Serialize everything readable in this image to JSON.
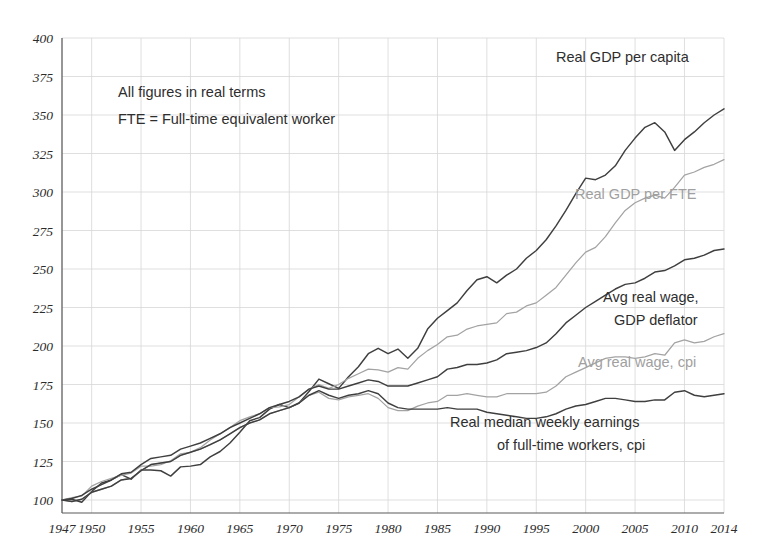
{
  "chart_data": {
    "type": "line",
    "title": "",
    "xlabel": "",
    "ylabel": "",
    "xlim": [
      1947,
      2014
    ],
    "ylim": [
      100,
      400
    ],
    "ytick_step": 25,
    "grid": true,
    "legend_position": "inline-annotations",
    "index_base": "1947 = 100",
    "yticks": [
      "400",
      "375",
      "350",
      "325",
      "300",
      "275",
      "250",
      "225",
      "200",
      "175",
      "150",
      "125",
      "100"
    ],
    "xticks": [
      "1947",
      "1950",
      "1955",
      "1960",
      "1965",
      "1970",
      "1975",
      "1980",
      "1985",
      "1990",
      "1995",
      "2000",
      "2005",
      "2010",
      "2014"
    ],
    "annotations": [
      "All figures in real terms",
      "FTE = Full-time equivalent worker"
    ],
    "colors": {
      "dark": "#3f3f3f",
      "gray": "#a3a3a3",
      "grid": "#d7d7d7",
      "axis": "#5a5a5a"
    },
    "x": [
      1947,
      1948,
      1949,
      1950,
      1951,
      1952,
      1953,
      1954,
      1955,
      1956,
      1957,
      1958,
      1959,
      1960,
      1961,
      1962,
      1963,
      1964,
      1965,
      1966,
      1967,
      1968,
      1969,
      1970,
      1971,
      1972,
      1973,
      1974,
      1975,
      1976,
      1977,
      1978,
      1979,
      1980,
      1981,
      1982,
      1983,
      1984,
      1985,
      1986,
      1987,
      1988,
      1989,
      1990,
      1991,
      1992,
      1993,
      1994,
      1995,
      1996,
      1997,
      1998,
      1999,
      2000,
      2001,
      2002,
      2003,
      2004,
      2005,
      2006,
      2007,
      2008,
      2009,
      2010,
      2011,
      2012,
      2013,
      2014
    ],
    "series": [
      {
        "name": "Real GDP per capita",
        "color": "#3f3f3f",
        "label_text": "Real GDP per capita",
        "label_style": "dark",
        "values": [
          100,
          100.5,
          98.5,
          105.5,
          111,
          113,
          116.5,
          113.5,
          119.5,
          119.5,
          119,
          115.5,
          121.5,
          122,
          123,
          128,
          131.5,
          137,
          144,
          151.5,
          153.5,
          159,
          162,
          160,
          163,
          170.5,
          178.5,
          175.5,
          172.5,
          180,
          186.5,
          195,
          198.5,
          195,
          198,
          192,
          198.5,
          211,
          218,
          223,
          228,
          236,
          243,
          245,
          241,
          246,
          250,
          257,
          262,
          269,
          278,
          288,
          299,
          309,
          308,
          311,
          317,
          327,
          335,
          342,
          345,
          339,
          327,
          334,
          339,
          345,
          350,
          354
        ]
      },
      {
        "name": "Real GDP per FTE",
        "color": "#a3a3a3",
        "label_text": "Real GDP per FTE",
        "label_style": "gray",
        "values": [
          100,
          101.5,
          102.5,
          109,
          112,
          114,
          116,
          117.5,
          122,
          122,
          123,
          125.5,
          130,
          131,
          134,
          139,
          143,
          147,
          151.5,
          154,
          156,
          160,
          160.5,
          162,
          167,
          172,
          175,
          172.5,
          175,
          179,
          182,
          185,
          184.5,
          183,
          186,
          185,
          192,
          197,
          201,
          206,
          207,
          211,
          213,
          214,
          215,
          221,
          222,
          226,
          228,
          233,
          238,
          246,
          254,
          261,
          264,
          271,
          280,
          288,
          293,
          296,
          298,
          296,
          303,
          311,
          313,
          316,
          318,
          321
        ]
      },
      {
        "name": "Avg real wage, GDP deflator",
        "color": "#3f3f3f",
        "label_text": "Avg real wage,",
        "label_text2": "GDP deflator",
        "label_style": "dark",
        "values": [
          100,
          101,
          103,
          107,
          110,
          113,
          117,
          118,
          123,
          127,
          128,
          129,
          133,
          135,
          137,
          140,
          143,
          147,
          150,
          153,
          156,
          160,
          162,
          164,
          167,
          172,
          174,
          172,
          172,
          174,
          176,
          178,
          177,
          174,
          174,
          174,
          176,
          178,
          180,
          185,
          186,
          188,
          188,
          189,
          191,
          195,
          196,
          197,
          199,
          202,
          208,
          215,
          220,
          225,
          229,
          233,
          237,
          240,
          241,
          244,
          248,
          249,
          252,
          256,
          257,
          259,
          262,
          263
        ]
      },
      {
        "name": "Avg real wage, cpi",
        "color": "#a3a3a3",
        "label_text": "Avg real wage, cpi",
        "label_style": "gray",
        "values": [
          100,
          99,
          100.5,
          105,
          107,
          109,
          113,
          114,
          119,
          123,
          124,
          125,
          129,
          131,
          133,
          136,
          139,
          143,
          147,
          150,
          152,
          156,
          158,
          160,
          163,
          168,
          170,
          166,
          165,
          167,
          168,
          169,
          166,
          160,
          158,
          158,
          161,
          163,
          164,
          168,
          168,
          169,
          168,
          167,
          167,
          169,
          169,
          169,
          169,
          170,
          174,
          180,
          183,
          186,
          189,
          192,
          193,
          193,
          192,
          193,
          195,
          194,
          202,
          204,
          202,
          203,
          206,
          208
        ]
      },
      {
        "name": "Real median weekly earnings of full-time workers, cpi",
        "color": "#3f3f3f",
        "label_text": "Real median weekly earnings",
        "label_text2": "of full-time workers, cpi",
        "label_style": "dark",
        "values": [
          100,
          99,
          100.5,
          105,
          107,
          109,
          113,
          114,
          119,
          123,
          124,
          125,
          129,
          131,
          133,
          136,
          139,
          143,
          147,
          150,
          152,
          156,
          158,
          160,
          163,
          168,
          171,
          168,
          166,
          168,
          169,
          171,
          169,
          163,
          160,
          159,
          159,
          159,
          159,
          160,
          159,
          159,
          159,
          157,
          156,
          155,
          154,
          153,
          153,
          154,
          156,
          159,
          161,
          162,
          164,
          166,
          166,
          165,
          164,
          164,
          165,
          165,
          170,
          171,
          168,
          167,
          168,
          169
        ]
      }
    ]
  },
  "plot_geometry": {
    "left": 62,
    "right": 724,
    "top": 38,
    "bottom": 500
  },
  "labels": {
    "real_gdp_per_capita": {
      "text": "Real GDP per capita",
      "x": 556,
      "y": 62
    },
    "real_gdp_per_fte": {
      "text": "Real GDP per FTE",
      "x": 575,
      "y": 199
    },
    "avg_real_wage_gdp_deflator_1": {
      "text": "Avg real wage,",
      "x": 603,
      "y": 302
    },
    "avg_real_wage_gdp_deflator_2": {
      "text": "GDP deflator",
      "x": 614,
      "y": 325
    },
    "avg_real_wage_cpi": {
      "text": "Avg real wage, cpi",
      "x": 578,
      "y": 367
    },
    "real_median_weekly_1": {
      "text": "Real median weekly earnings",
      "x": 450,
      "y": 427
    },
    "real_median_weekly_2": {
      "text": "of full-time workers, cpi",
      "x": 497,
      "y": 450
    }
  },
  "notes": {
    "line1": {
      "text": "All figures in real terms",
      "x": 118,
      "y": 97
    },
    "line2": {
      "text": "FTE = Full-time equivalent worker",
      "x": 118,
      "y": 124
    }
  }
}
